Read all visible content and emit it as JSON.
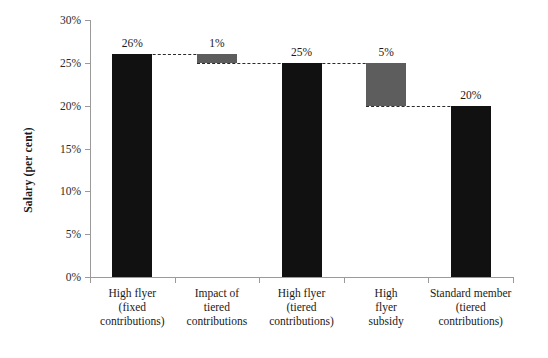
{
  "chart_data": {
    "type": "bar",
    "subtype": "waterfall",
    "title": "",
    "xlabel": "",
    "ylabel": "Salary (per cent)",
    "ylim": [
      0,
      30
    ],
    "ytick_values": [
      0,
      5,
      10,
      15,
      20,
      25,
      30
    ],
    "ytick_labels": [
      "0%",
      "5%",
      "10%",
      "15%",
      "20%",
      "25%",
      "30%"
    ],
    "grid": false,
    "legend": "none",
    "value_suffix": "%",
    "categories": [
      "High flyer (fixed contributions)",
      "Impact of tiered contributions",
      "High flyer (tiered contributions)",
      "High flyer subsidy",
      "Standard member (tiered contributions)"
    ],
    "category_lines": [
      [
        "High flyer",
        "(fixed",
        "contributions)"
      ],
      [
        "Impact of",
        "tiered",
        "contributions"
      ],
      [
        "High flyer",
        "(tiered",
        "contributions)"
      ],
      [
        "High",
        "flyer",
        "subsidy"
      ],
      [
        "Standard member",
        "(tiered",
        "contributions)"
      ]
    ],
    "values": [
      26,
      1,
      25,
      5,
      20
    ],
    "value_labels": [
      "26%",
      "1%",
      "25%",
      "5%",
      "20%"
    ],
    "bars": [
      {
        "label": "26%",
        "base": 0,
        "top": 26,
        "value": 26,
        "color": "#111111",
        "style": "black"
      },
      {
        "label": "1%",
        "base": 25,
        "top": 26,
        "value": 1,
        "color": "#5d5d5d",
        "style": "gray"
      },
      {
        "label": "25%",
        "base": 0,
        "top": 25,
        "value": 25,
        "color": "#111111",
        "style": "black"
      },
      {
        "label": "5%",
        "base": 20,
        "top": 25,
        "value": 5,
        "color": "#5d5d5d",
        "style": "gray"
      },
      {
        "label": "20%",
        "base": 0,
        "top": 20,
        "value": 20,
        "color": "#111111",
        "style": "black"
      }
    ],
    "connectors": [
      {
        "from_bar": 0,
        "to_bar": 1,
        "level": 26
      },
      {
        "from_bar": 1,
        "to_bar": 2,
        "level": 25
      },
      {
        "from_bar": 2,
        "to_bar": 3,
        "level": 25
      },
      {
        "from_bar": 3,
        "to_bar": 4,
        "level": 20
      }
    ],
    "colors": {
      "bar_black": "#111111",
      "bar_gray": "#5d5d5d",
      "axis": "#9a9a9a",
      "connector": "#2b2b2b",
      "text": "#1a1a1a",
      "background": "#ffffff"
    }
  }
}
